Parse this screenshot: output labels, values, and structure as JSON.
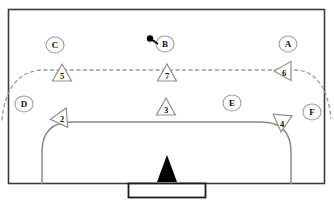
{
  "diagram": {
    "colors": {
      "border": "#3a3a3a",
      "line": "#7c7c7c",
      "dashed": "#9a9a9a",
      "marker_fill": "#000000",
      "text": "#111111",
      "background": "#ffffff"
    },
    "field": {
      "outer_border": {
        "x": 8,
        "y": 9,
        "width": 317,
        "height": 175
      },
      "penalty_arc": {
        "left": 42,
        "right": 291,
        "top": 122,
        "bottom": 184
      },
      "goal_box": {
        "x": 128,
        "y": 183,
        "width": 78,
        "height": 15
      },
      "goal_marker": {
        "x": 167,
        "y": 157,
        "label": "goal-marker-triangle"
      },
      "dashed_arc_label": "three-point-dashed-arc"
    },
    "players": [
      {
        "id": "p5",
        "label": "5",
        "x": 62,
        "y": 74,
        "rotation": 0,
        "shape": "triangle"
      },
      {
        "id": "p7",
        "label": "7",
        "x": 167,
        "y": 74,
        "rotation": 0,
        "shape": "triangle"
      },
      {
        "id": "p6",
        "label": "6",
        "x": 284,
        "y": 71,
        "rotation": -90,
        "shape": "triangle"
      },
      {
        "id": "p2",
        "label": "2",
        "x": 62,
        "y": 117,
        "rotation": 25,
        "shape": "triangle"
      },
      {
        "id": "p3",
        "label": "3",
        "x": 166,
        "y": 108,
        "rotation": 0,
        "shape": "triangle"
      },
      {
        "id": "p4",
        "label": "4",
        "x": 282,
        "y": 122,
        "rotation": 185,
        "shape": "triangle"
      }
    ],
    "zones": [
      {
        "id": "zC",
        "label": "C",
        "x": 55,
        "y": 45
      },
      {
        "id": "zB",
        "label": "B",
        "x": 165,
        "y": 44
      },
      {
        "id": "zA",
        "label": "A",
        "x": 288,
        "y": 44
      },
      {
        "id": "zD",
        "label": "D",
        "x": 24,
        "y": 104
      },
      {
        "id": "zE",
        "label": "E",
        "x": 232,
        "y": 103
      },
      {
        "id": "zF",
        "label": "F",
        "x": 312,
        "y": 112
      }
    ],
    "ball": {
      "id": "ball",
      "x": 150,
      "y": 39,
      "radius": 3.2,
      "stick_to_x": 157,
      "stick_to_y": 43
    }
  }
}
